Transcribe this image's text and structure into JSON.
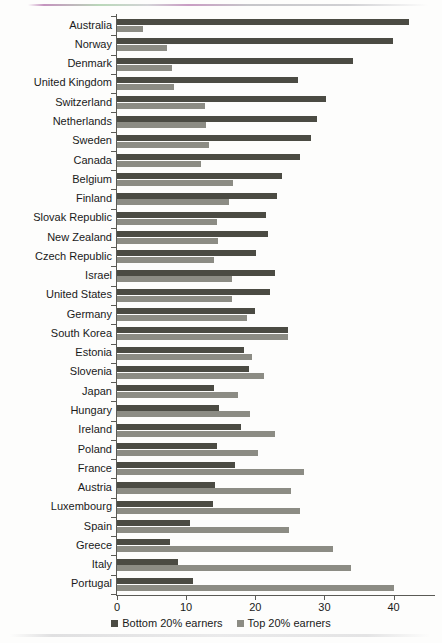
{
  "chart_data": {
    "type": "bar",
    "orientation": "horizontal",
    "title": "",
    "subtitle": "",
    "xlabel": "",
    "ylabel": "",
    "xlim": [
      0,
      46
    ],
    "xticks": [
      0,
      10,
      20,
      30,
      40
    ],
    "xtick_labels": [
      "0",
      "10",
      "20",
      "30",
      "40"
    ],
    "grid": false,
    "legend_position": "bottom",
    "categories": [
      "Australia",
      "Norway",
      "Denmark",
      "United Kingdom",
      "Switzerland",
      "Netherlands",
      "Sweden",
      "Canada",
      "Belgium",
      "Finland",
      "Slovak Republic",
      "New Zealand",
      "Czech Republic",
      "Israel",
      "United States",
      "Germany",
      "South Korea",
      "Estonia",
      "Slovenia",
      "Japan",
      "Hungary",
      "Ireland",
      "Poland",
      "France",
      "Austria",
      "Luxembourg",
      "Spain",
      "Greece",
      "Italy",
      "Portugal"
    ],
    "series": [
      {
        "name": "Bottom 20% earners",
        "color": "#4b4b43",
        "values": [
          42.2,
          39.9,
          34.1,
          26.2,
          30.3,
          29.0,
          28.0,
          26.5,
          23.8,
          23.2,
          21.5,
          21.9,
          20.1,
          22.8,
          22.2,
          20.0,
          24.8,
          18.4,
          19.1,
          14.1,
          14.8,
          18.0,
          14.4,
          17.0,
          14.2,
          13.9,
          10.6,
          7.7,
          8.8,
          11.0
        ]
      },
      {
        "name": "Top 20% earners",
        "color": "#8c8c84",
        "values": [
          3.8,
          7.2,
          8.0,
          8.3,
          12.8,
          12.9,
          13.3,
          12.2,
          16.8,
          16.2,
          14.4,
          14.6,
          14.1,
          16.7,
          16.7,
          18.8,
          24.8,
          19.6,
          21.2,
          17.5,
          19.3,
          22.9,
          20.4,
          27.0,
          25.2,
          26.4,
          24.9,
          31.2,
          33.9,
          40.1
        ]
      }
    ]
  },
  "legend": {
    "entries": [
      {
        "label": "Bottom 20% earners",
        "color": "#4b4b43"
      },
      {
        "label": "Top 20% earners",
        "color": "#8c8c84"
      }
    ]
  },
  "axis": {
    "value_axis_name": "value-axis",
    "category_axis_name": "category-axis"
  }
}
